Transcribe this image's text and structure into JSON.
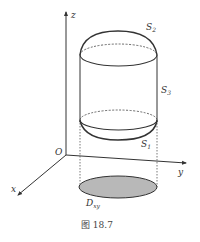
{
  "figure": {
    "caption": "图 18.7",
    "axes": {
      "origin_label": "O",
      "x_label": "x",
      "y_label": "y",
      "z_label": "z"
    },
    "surfaces": {
      "top": {
        "label": "S",
        "subscript": "2"
      },
      "side": {
        "label": "S",
        "subscript": "3"
      },
      "bottom": {
        "label": "S",
        "subscript": "1"
      }
    },
    "region": {
      "label": "D",
      "subscript": "xy",
      "fill_color": "#b8b8b8"
    },
    "colors": {
      "line": "#333333",
      "text": "#333333"
    }
  }
}
